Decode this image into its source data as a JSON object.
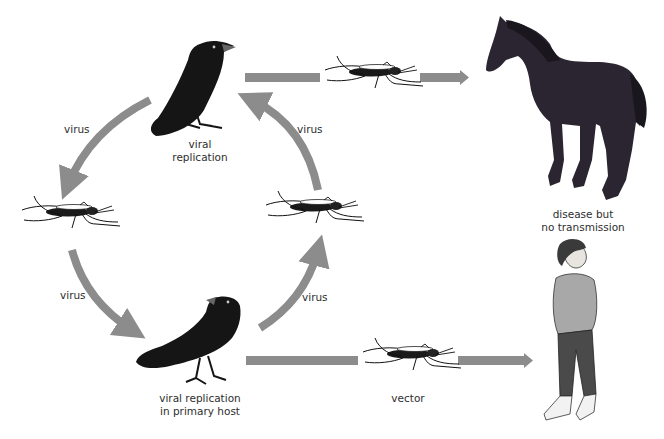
{
  "diagram": {
    "colors": {
      "arrow": "#8c8c8c",
      "bird": "#151515",
      "horse": "#2a2530",
      "text": "#2e2e2e",
      "sweater": "#a8a8a8",
      "pants": "#4a4a4a"
    },
    "nodes": {
      "bird_top": {
        "icon": "crow-icon",
        "label_line1": "viral",
        "label_line2": "replication"
      },
      "bird_bottom": {
        "icon": "crow-icon",
        "label_line1": "viral replication",
        "label_line2": "in primary host"
      },
      "mosquito_left": {
        "icon": "mosquito-icon"
      },
      "mosquito_right": {
        "icon": "mosquito-icon"
      },
      "mosquito_top": {
        "icon": "mosquito-icon"
      },
      "mosquito_bottom": {
        "icon": "mosquito-icon",
        "label": "vector"
      },
      "horse": {
        "icon": "horse-icon",
        "label_line1": "disease but",
        "label_line2": "no transmission"
      },
      "human": {
        "icon": "human-icon"
      }
    },
    "edges": {
      "top_left_arc": {
        "label": "virus"
      },
      "top_right_arc": {
        "label": "virus"
      },
      "bottom_left_arc": {
        "label": "virus"
      },
      "bottom_right_arc": {
        "label": "virus"
      }
    }
  }
}
